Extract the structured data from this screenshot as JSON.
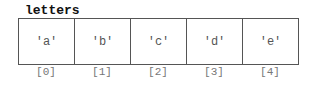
{
  "title": "letters",
  "cells": [
    {
      "value": "'a'",
      "index": "[0]"
    },
    {
      "value": "'b'",
      "index": "[1]"
    },
    {
      "value": "'c'",
      "index": "[2]"
    },
    {
      "value": "'d'",
      "index": "[3]"
    },
    {
      "value": "'e'",
      "index": "[4]"
    }
  ]
}
